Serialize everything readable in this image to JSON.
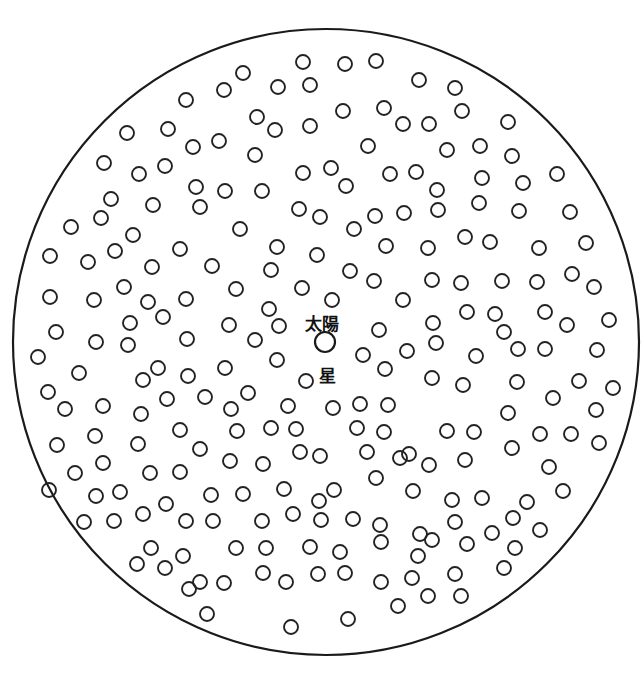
{
  "diagram": {
    "boundary": {
      "cx": 326,
      "cy": 342,
      "r": 313,
      "stroke": "#1a1a1a"
    },
    "labels": {
      "sun_label": "太陽",
      "star_label": "星"
    },
    "sun": {
      "cx": 325,
      "cy": 342,
      "r": 10
    },
    "star_radius": 7,
    "stars": [
      [
        303,
        62
      ],
      [
        345,
        64
      ],
      [
        376,
        61
      ],
      [
        243,
        73
      ],
      [
        224,
        90
      ],
      [
        186,
        100
      ],
      [
        278,
        87
      ],
      [
        310,
        85
      ],
      [
        419,
        80
      ],
      [
        455,
        88
      ],
      [
        127,
        133
      ],
      [
        168,
        129
      ],
      [
        193,
        147
      ],
      [
        219,
        141
      ],
      [
        257,
        117
      ],
      [
        275,
        130
      ],
      [
        310,
        126
      ],
      [
        343,
        111
      ],
      [
        384,
        108
      ],
      [
        403,
        124
      ],
      [
        429,
        124
      ],
      [
        462,
        111
      ],
      [
        508,
        122
      ],
      [
        104,
        163
      ],
      [
        139,
        174
      ],
      [
        165,
        166
      ],
      [
        255,
        155
      ],
      [
        368,
        146
      ],
      [
        447,
        150
      ],
      [
        480,
        146
      ],
      [
        512,
        156
      ],
      [
        557,
        174
      ],
      [
        111,
        199
      ],
      [
        196,
        187
      ],
      [
        225,
        191
      ],
      [
        262,
        191
      ],
      [
        303,
        173
      ],
      [
        331,
        168
      ],
      [
        346,
        186
      ],
      [
        390,
        174
      ],
      [
        416,
        172
      ],
      [
        437,
        190
      ],
      [
        482,
        178
      ],
      [
        523,
        183
      ],
      [
        71,
        227
      ],
      [
        101,
        218
      ],
      [
        153,
        205
      ],
      [
        200,
        207
      ],
      [
        299,
        209
      ],
      [
        320,
        217
      ],
      [
        354,
        229
      ],
      [
        375,
        216
      ],
      [
        404,
        213
      ],
      [
        438,
        210
      ],
      [
        479,
        203
      ],
      [
        519,
        211
      ],
      [
        570,
        212
      ],
      [
        50,
        256
      ],
      [
        88,
        262
      ],
      [
        115,
        251
      ],
      [
        133,
        235
      ],
      [
        152,
        267
      ],
      [
        180,
        249
      ],
      [
        212,
        266
      ],
      [
        240,
        229
      ],
      [
        277,
        247
      ],
      [
        317,
        255
      ],
      [
        386,
        246
      ],
      [
        428,
        248
      ],
      [
        465,
        237
      ],
      [
        490,
        242
      ],
      [
        539,
        248
      ],
      [
        586,
        243
      ],
      [
        50,
        297
      ],
      [
        94,
        300
      ],
      [
        124,
        287
      ],
      [
        148,
        302
      ],
      [
        186,
        299
      ],
      [
        236,
        289
      ],
      [
        271,
        270
      ],
      [
        302,
        288
      ],
      [
        332,
        300
      ],
      [
        350,
        271
      ],
      [
        374,
        281
      ],
      [
        403,
        300
      ],
      [
        432,
        280
      ],
      [
        461,
        283
      ],
      [
        502,
        281
      ],
      [
        537,
        282
      ],
      [
        572,
        274
      ],
      [
        594,
        287
      ],
      [
        56,
        332
      ],
      [
        96,
        342
      ],
      [
        130,
        323
      ],
      [
        163,
        317
      ],
      [
        187,
        339
      ],
      [
        229,
        325
      ],
      [
        255,
        340
      ],
      [
        279,
        326
      ],
      [
        269,
        309
      ],
      [
        379,
        330
      ],
      [
        407,
        351
      ],
      [
        433,
        323
      ],
      [
        467,
        312
      ],
      [
        495,
        314
      ],
      [
        504,
        332
      ],
      [
        545,
        312
      ],
      [
        567,
        325
      ],
      [
        609,
        320
      ],
      [
        38,
        357
      ],
      [
        79,
        373
      ],
      [
        128,
        345
      ],
      [
        143,
        380
      ],
      [
        158,
        368
      ],
      [
        188,
        376
      ],
      [
        225,
        368
      ],
      [
        248,
        393
      ],
      [
        277,
        360
      ],
      [
        363,
        355
      ],
      [
        385,
        369
      ],
      [
        436,
        343
      ],
      [
        476,
        356
      ],
      [
        518,
        349
      ],
      [
        545,
        349
      ],
      [
        597,
        350
      ],
      [
        48,
        392
      ],
      [
        65,
        409
      ],
      [
        103,
        406
      ],
      [
        141,
        414
      ],
      [
        167,
        399
      ],
      [
        205,
        397
      ],
      [
        231,
        409
      ],
      [
        288,
        406
      ],
      [
        306,
        381
      ],
      [
        333,
        408
      ],
      [
        360,
        404
      ],
      [
        388,
        405
      ],
      [
        432,
        378
      ],
      [
        463,
        385
      ],
      [
        517,
        382
      ],
      [
        553,
        398
      ],
      [
        579,
        381
      ],
      [
        613,
        388
      ],
      [
        57,
        445
      ],
      [
        95,
        436
      ],
      [
        138,
        444
      ],
      [
        180,
        430
      ],
      [
        200,
        449
      ],
      [
        237,
        431
      ],
      [
        271,
        428
      ],
      [
        296,
        429
      ],
      [
        320,
        456
      ],
      [
        357,
        428
      ],
      [
        384,
        432
      ],
      [
        409,
        454
      ],
      [
        447,
        431
      ],
      [
        474,
        432
      ],
      [
        508,
        413
      ],
      [
        540,
        434
      ],
      [
        571,
        434
      ],
      [
        596,
        410
      ],
      [
        599,
        443
      ],
      [
        75,
        473
      ],
      [
        103,
        463
      ],
      [
        150,
        473
      ],
      [
        180,
        472
      ],
      [
        230,
        461
      ],
      [
        263,
        464
      ],
      [
        300,
        452
      ],
      [
        334,
        490
      ],
      [
        367,
        452
      ],
      [
        400,
        458
      ],
      [
        429,
        465
      ],
      [
        465,
        460
      ],
      [
        512,
        448
      ],
      [
        549,
        467
      ],
      [
        49,
        490
      ],
      [
        96,
        496
      ],
      [
        120,
        492
      ],
      [
        166,
        504
      ],
      [
        211,
        495
      ],
      [
        243,
        494
      ],
      [
        284,
        489
      ],
      [
        319,
        501
      ],
      [
        376,
        478
      ],
      [
        413,
        491
      ],
      [
        452,
        500
      ],
      [
        482,
        498
      ],
      [
        527,
        502
      ],
      [
        563,
        491
      ],
      [
        84,
        522
      ],
      [
        114,
        521
      ],
      [
        143,
        514
      ],
      [
        186,
        521
      ],
      [
        213,
        521
      ],
      [
        262,
        521
      ],
      [
        293,
        514
      ],
      [
        321,
        520
      ],
      [
        353,
        519
      ],
      [
        380,
        525
      ],
      [
        420,
        534
      ],
      [
        432,
        540
      ],
      [
        455,
        522
      ],
      [
        492,
        533
      ],
      [
        513,
        518
      ],
      [
        540,
        530
      ],
      [
        151,
        548
      ],
      [
        183,
        556
      ],
      [
        236,
        548
      ],
      [
        266,
        548
      ],
      [
        310,
        547
      ],
      [
        340,
        552
      ],
      [
        381,
        542
      ],
      [
        418,
        556
      ],
      [
        467,
        544
      ],
      [
        515,
        548
      ],
      [
        137,
        564
      ],
      [
        165,
        568
      ],
      [
        200,
        582
      ],
      [
        224,
        583
      ],
      [
        263,
        573
      ],
      [
        286,
        582
      ],
      [
        318,
        574
      ],
      [
        345,
        573
      ],
      [
        381,
        582
      ],
      [
        412,
        578
      ],
      [
        455,
        574
      ],
      [
        504,
        568
      ],
      [
        189,
        589
      ],
      [
        207,
        614
      ],
      [
        291,
        627
      ],
      [
        348,
        619
      ],
      [
        398,
        606
      ],
      [
        428,
        596
      ],
      [
        461,
        596
      ]
    ]
  }
}
